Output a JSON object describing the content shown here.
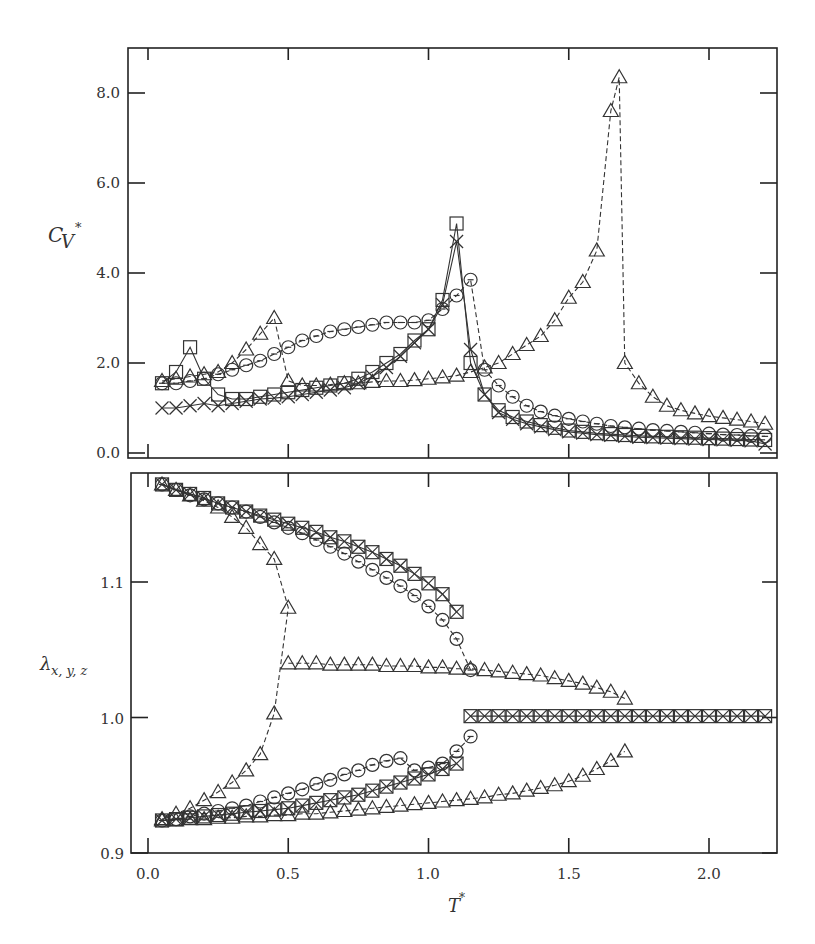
{
  "chart_data": [
    {
      "type": "scatter",
      "panel": "upper",
      "title": "",
      "xlabel": "T*",
      "ylabel": "C_V*",
      "xlim": [
        -0.07,
        2.25
      ],
      "ylim": [
        -0.1,
        9.0
      ],
      "xticks": [
        0.0,
        0.5,
        1.0,
        1.5,
        2.0
      ],
      "yticks": [
        0.0,
        2.0,
        4.0,
        6.0,
        8.0
      ],
      "ytick_labels": [
        "0.0",
        "2.0",
        "4.0",
        "6.0",
        "8.0"
      ],
      "grid": false,
      "legend": "none",
      "series": [
        {
          "name": "square",
          "marker": "square",
          "line": "solid",
          "x": [
            0.05,
            0.1,
            0.15,
            0.2,
            0.25,
            0.3,
            0.35,
            0.4,
            0.45,
            0.5,
            0.55,
            0.6,
            0.65,
            0.7,
            0.75,
            0.8,
            0.85,
            0.9,
            0.95,
            1.0,
            1.05,
            1.1,
            1.15,
            1.2,
            1.25,
            1.3,
            1.35,
            1.4,
            1.45,
            1.5,
            1.55,
            1.6,
            1.65,
            1.7,
            1.75,
            1.8,
            1.85,
            1.9,
            1.95,
            2.0,
            2.05,
            2.1,
            2.15,
            2.2
          ],
          "y": [
            1.55,
            1.8,
            2.35,
            1.65,
            1.3,
            1.2,
            1.2,
            1.25,
            1.3,
            1.35,
            1.4,
            1.45,
            1.5,
            1.55,
            1.65,
            1.8,
            2.0,
            2.2,
            2.5,
            2.75,
            3.4,
            5.1,
            2.0,
            1.3,
            0.95,
            0.8,
            0.7,
            0.62,
            0.56,
            0.5,
            0.47,
            0.44,
            0.42,
            0.4,
            0.38,
            0.37,
            0.36,
            0.35,
            0.34,
            0.33,
            0.32,
            0.31,
            0.3,
            0.29
          ]
        },
        {
          "name": "cross",
          "marker": "x",
          "line": "solid",
          "x": [
            0.05,
            0.1,
            0.15,
            0.2,
            0.25,
            0.3,
            0.35,
            0.4,
            0.45,
            0.5,
            0.55,
            0.6,
            0.65,
            0.7,
            0.75,
            0.8,
            0.85,
            0.9,
            0.95,
            1.0,
            1.05,
            1.1,
            1.15,
            1.2,
            1.25,
            1.3,
            1.35,
            1.4,
            1.45,
            1.5,
            1.55,
            1.6,
            1.65,
            1.7,
            1.75,
            1.8,
            1.85,
            1.9,
            1.95,
            2.0,
            2.05,
            2.1,
            2.15,
            2.2
          ],
          "y": [
            1.0,
            1.0,
            1.05,
            1.1,
            1.05,
            1.1,
            1.15,
            1.2,
            1.22,
            1.25,
            1.3,
            1.35,
            1.4,
            1.45,
            1.55,
            1.7,
            1.9,
            2.15,
            2.45,
            2.75,
            3.3,
            4.7,
            2.3,
            1.3,
            0.9,
            0.75,
            0.65,
            0.58,
            0.52,
            0.47,
            0.44,
            0.41,
            0.39,
            0.37,
            0.35,
            0.34,
            0.33,
            0.32,
            0.31,
            0.3,
            0.29,
            0.28,
            0.27,
            0.2
          ]
        },
        {
          "name": "circle",
          "marker": "circle",
          "line": "dashed",
          "x": [
            0.05,
            0.1,
            0.15,
            0.2,
            0.25,
            0.3,
            0.35,
            0.4,
            0.45,
            0.5,
            0.55,
            0.6,
            0.65,
            0.7,
            0.75,
            0.8,
            0.85,
            0.9,
            0.95,
            1.0,
            1.05,
            1.1,
            1.15,
            1.2,
            1.25,
            1.3,
            1.35,
            1.4,
            1.45,
            1.5,
            1.55,
            1.6,
            1.65,
            1.7,
            1.75,
            1.8,
            1.85,
            1.9,
            1.95,
            2.0,
            2.05,
            2.1,
            2.15,
            2.2
          ],
          "y": [
            1.55,
            1.55,
            1.6,
            1.65,
            1.75,
            1.85,
            1.95,
            2.05,
            2.2,
            2.35,
            2.5,
            2.6,
            2.7,
            2.75,
            2.8,
            2.85,
            2.9,
            2.9,
            2.9,
            2.95,
            3.2,
            3.5,
            3.85,
            1.85,
            1.5,
            1.25,
            1.05,
            0.92,
            0.83,
            0.76,
            0.7,
            0.65,
            0.6,
            0.57,
            0.54,
            0.51,
            0.49,
            0.47,
            0.45,
            0.43,
            0.41,
            0.4,
            0.38,
            0.37
          ]
        },
        {
          "name": "triangle",
          "marker": "triangle",
          "line": "dashed",
          "x": [
            0.05,
            0.1,
            0.15,
            0.2,
            0.25,
            0.3,
            0.35,
            0.4,
            0.45,
            0.5,
            0.55,
            0.6,
            0.65,
            0.7,
            0.75,
            0.8,
            0.85,
            0.9,
            0.95,
            1.0,
            1.05,
            1.1,
            1.15,
            1.2,
            1.25,
            1.3,
            1.35,
            1.4,
            1.45,
            1.5,
            1.55,
            1.6,
            1.65,
            1.68,
            1.7,
            1.75,
            1.8,
            1.85,
            1.9,
            1.95,
            2.0,
            2.05,
            2.1,
            2.15,
            2.2
          ],
          "y": [
            1.6,
            1.65,
            1.7,
            1.75,
            1.8,
            2.0,
            2.3,
            2.65,
            3.0,
            1.6,
            1.5,
            1.5,
            1.52,
            1.55,
            1.55,
            1.58,
            1.6,
            1.6,
            1.62,
            1.65,
            1.68,
            1.72,
            1.8,
            1.9,
            2.0,
            2.2,
            2.4,
            2.6,
            2.95,
            3.45,
            3.8,
            4.5,
            7.6,
            8.35,
            2.0,
            1.55,
            1.25,
            1.05,
            0.95,
            0.88,
            0.82,
            0.78,
            0.74,
            0.7,
            0.65
          ]
        }
      ]
    },
    {
      "type": "scatter",
      "panel": "lower",
      "title": "",
      "xlabel": "T*",
      "ylabel": "λ_{x, y, z}",
      "xlim": [
        -0.07,
        2.25
      ],
      "ylim": [
        0.9,
        1.177
      ],
      "xticks": [
        0.0,
        0.5,
        1.0,
        1.5,
        2.0
      ],
      "xtick_labels": [
        "0.0",
        "0.5",
        "1.0",
        "1.5",
        "2.0"
      ],
      "yticks": [
        0.9,
        1.0,
        1.1
      ],
      "ytick_labels": [
        "0.9",
        "1.0",
        "1.1"
      ],
      "grid": false,
      "legend": "none",
      "series": [
        {
          "name": "square-upper",
          "marker": "square",
          "line": "solid",
          "x": [
            0.05,
            0.1,
            0.15,
            0.2,
            0.25,
            0.3,
            0.35,
            0.4,
            0.45,
            0.5,
            0.55,
            0.6,
            0.65,
            0.7,
            0.75,
            0.8,
            0.85,
            0.9,
            0.95,
            1.0,
            1.05,
            1.1
          ],
          "y": [
            1.172,
            1.168,
            1.165,
            1.162,
            1.158,
            1.155,
            1.152,
            1.149,
            1.146,
            1.143,
            1.14,
            1.137,
            1.133,
            1.13,
            1.126,
            1.122,
            1.117,
            1.112,
            1.106,
            1.099,
            1.091,
            1.078
          ]
        },
        {
          "name": "square-lower",
          "marker": "square",
          "line": "solid",
          "x": [
            0.05,
            0.1,
            0.15,
            0.2,
            0.25,
            0.3,
            0.35,
            0.4,
            0.45,
            0.5,
            0.55,
            0.6,
            0.65,
            0.7,
            0.75,
            0.8,
            0.85,
            0.9,
            0.95,
            1.0,
            1.05,
            1.1
          ],
          "y": [
            0.924,
            0.925,
            0.926,
            0.927,
            0.928,
            0.929,
            0.93,
            0.931,
            0.932,
            0.933,
            0.935,
            0.937,
            0.939,
            0.941,
            0.943,
            0.946,
            0.949,
            0.952,
            0.955,
            0.958,
            0.962,
            0.966
          ]
        },
        {
          "name": "square-high-T",
          "marker": "square-x",
          "line": "solid",
          "x": [
            1.15,
            1.2,
            1.25,
            1.3,
            1.35,
            1.4,
            1.45,
            1.5,
            1.55,
            1.6,
            1.65,
            1.7,
            1.75,
            1.8,
            1.85,
            1.9,
            1.95,
            2.0,
            2.05,
            2.1,
            2.15,
            2.2
          ],
          "y": [
            1.001,
            1.001,
            1.001,
            1.001,
            1.001,
            1.001,
            1.001,
            1.001,
            1.001,
            1.001,
            1.001,
            1.001,
            1.001,
            1.001,
            1.001,
            1.001,
            1.001,
            1.001,
            1.001,
            1.001,
            1.001,
            1.001
          ]
        },
        {
          "name": "circle-upper",
          "marker": "circle",
          "line": "dashed",
          "x": [
            0.05,
            0.1,
            0.15,
            0.2,
            0.25,
            0.3,
            0.35,
            0.4,
            0.45,
            0.5,
            0.55,
            0.6,
            0.65,
            0.7,
            0.75,
            0.8,
            0.85,
            0.9,
            0.95,
            1.0,
            1.05,
            1.1,
            1.15
          ],
          "y": [
            1.172,
            1.168,
            1.164,
            1.161,
            1.158,
            1.155,
            1.152,
            1.148,
            1.144,
            1.14,
            1.136,
            1.131,
            1.126,
            1.121,
            1.115,
            1.109,
            1.103,
            1.097,
            1.09,
            1.082,
            1.072,
            1.058,
            1.035
          ]
        },
        {
          "name": "circle-lower",
          "marker": "circle",
          "line": "dashed",
          "x": [
            0.05,
            0.1,
            0.15,
            0.2,
            0.25,
            0.3,
            0.35,
            0.4,
            0.45,
            0.5,
            0.55,
            0.6,
            0.65,
            0.7,
            0.75,
            0.8,
            0.85,
            0.9,
            0.95,
            1.0,
            1.05,
            1.1,
            1.15
          ],
          "y": [
            0.924,
            0.925,
            0.927,
            0.929,
            0.931,
            0.933,
            0.935,
            0.938,
            0.941,
            0.944,
            0.947,
            0.951,
            0.954,
            0.958,
            0.961,
            0.965,
            0.968,
            0.97,
            0.961,
            0.963,
            0.966,
            0.975,
            0.986
          ]
        },
        {
          "name": "triangle-middle",
          "marker": "triangle",
          "line": "dashed",
          "x": [
            0.5,
            0.55,
            0.6,
            0.65,
            0.7,
            0.75,
            0.8,
            0.85,
            0.9,
            0.95,
            1.0,
            1.05,
            1.1,
            1.15,
            1.2,
            1.25,
            1.3,
            1.35,
            1.4,
            1.45,
            1.5,
            1.55,
            1.6,
            1.65,
            1.7
          ],
          "y": [
            1.04,
            1.04,
            1.04,
            1.039,
            1.039,
            1.039,
            1.039,
            1.038,
            1.038,
            1.038,
            1.037,
            1.037,
            1.036,
            1.036,
            1.035,
            1.034,
            1.033,
            1.032,
            1.031,
            1.029,
            1.027,
            1.025,
            1.022,
            1.019,
            1.014
          ]
        },
        {
          "name": "triangle-branch",
          "marker": "triangle",
          "line": "dashed",
          "x": [
            0.05,
            0.1,
            0.15,
            0.2,
            0.25,
            0.3,
            0.35,
            0.4,
            0.45,
            0.5,
            0.45,
            0.4,
            0.35,
            0.3,
            0.25,
            0.2,
            0.15,
            0.1,
            0.05
          ],
          "y": [
            1.172,
            1.168,
            1.164,
            1.16,
            1.155,
            1.148,
            1.14,
            1.128,
            1.117,
            1.081,
            1.003,
            0.973,
            0.961,
            0.952,
            0.945,
            0.939,
            0.933,
            0.929,
            0.925
          ]
        },
        {
          "name": "triangle-lower",
          "marker": "triangle",
          "line": "dashed",
          "x": [
            0.05,
            0.1,
            0.15,
            0.2,
            0.25,
            0.3,
            0.35,
            0.4,
            0.45,
            0.5,
            0.55,
            0.6,
            0.65,
            0.7,
            0.75,
            0.8,
            0.85,
            0.9,
            0.95,
            1.0,
            1.05,
            1.1,
            1.15,
            1.2,
            1.25,
            1.3,
            1.35,
            1.4,
            1.45,
            1.5,
            1.55,
            1.6,
            1.65,
            1.7
          ],
          "y": [
            0.924,
            0.924,
            0.925,
            0.925,
            0.926,
            0.926,
            0.927,
            0.927,
            0.928,
            0.928,
            0.929,
            0.929,
            0.93,
            0.931,
            0.932,
            0.933,
            0.934,
            0.935,
            0.936,
            0.937,
            0.938,
            0.939,
            0.94,
            0.941,
            0.943,
            0.944,
            0.946,
            0.948,
            0.95,
            0.953,
            0.957,
            0.962,
            0.968,
            0.975
          ]
        }
      ]
    }
  ],
  "upper_panel": {
    "ylabel_main": "C",
    "ylabel_sub": "V",
    "ylabel_sup": "*",
    "ytick_labels": [
      "0.0",
      "2.0",
      "4.0",
      "6.0",
      "8.0"
    ]
  },
  "lower_panel": {
    "ylabel_main": "λ",
    "ylabel_sub": "x, y, z",
    "ytick_labels": [
      "0.9",
      "1.0",
      "1.1"
    ],
    "xtick_labels": [
      "0.0",
      "0.5",
      "1.0",
      "1.5",
      "2.0"
    ],
    "xlabel_main": "T",
    "xlabel_sup": "*"
  }
}
